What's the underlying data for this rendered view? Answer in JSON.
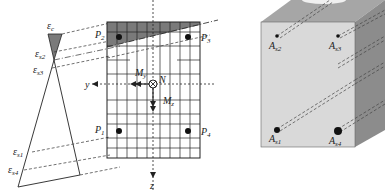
{
  "strain_diagram": {
    "labels": {
      "eps_c": "ε",
      "eps_c_sub": "c",
      "eps_s2": "ε",
      "eps_s2_sub": "s2",
      "eps_s3": "ε",
      "eps_s3_sub": "s3",
      "eps_s1": "ε",
      "eps_s1_sub": "s1",
      "eps_s4": "ε",
      "eps_s4_sub": "s4"
    }
  },
  "cross_section": {
    "points": {
      "p1": "P",
      "p1_sub": "1",
      "p2": "P",
      "p2_sub": "2",
      "p3": "P",
      "p3_sub": "3",
      "p4": "P",
      "p4_sub": "4"
    },
    "axes": {
      "y": "y",
      "z": "z"
    },
    "loads": {
      "my": "M",
      "my_sub": "y",
      "mz": "M",
      "mz_sub": "z",
      "n": "N"
    },
    "colors": {
      "compression_zone": "#7a7a7a",
      "grid": "#222222"
    }
  },
  "beam_3d": {
    "rebars": {
      "as1": "A",
      "as1_sub": "s1",
      "as2": "A",
      "as2_sub": "s2",
      "as3": "A",
      "as3_sub": "s3",
      "as4": "A",
      "as4_sub": "s4"
    },
    "colors": {
      "front": "#d9d9d9",
      "side": "#8c8c8c",
      "top": "#a6a6a6"
    }
  }
}
